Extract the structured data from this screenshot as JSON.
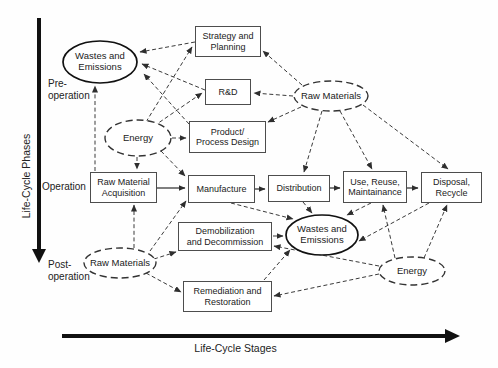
{
  "figure": {
    "y_axis_label": "Life-Cycle Phases",
    "x_axis_label": "Life-Cycle Stages",
    "phases": {
      "pre": "Pre-\noperation",
      "operation": "Operation",
      "post": "Post-\noperation"
    }
  },
  "nodes": {
    "strategy-planning": {
      "label": "Strategy and\nPlanning",
      "shape": "box"
    },
    "rd": {
      "label": "R&D",
      "shape": "box"
    },
    "product-process-design": {
      "label": "Product/\nProcess Design",
      "shape": "box"
    },
    "raw-material-acquisition": {
      "label": "Raw Material\nAcquisition",
      "shape": "box"
    },
    "manufacture": {
      "label": "Manufacture",
      "shape": "box"
    },
    "distribution": {
      "label": "Distribution",
      "shape": "box"
    },
    "use-reuse-maintainance": {
      "label": "Use, Reuse,\nMaintainance",
      "shape": "box"
    },
    "disposal-recycle": {
      "label": "Disposal,\nRecycle",
      "shape": "box"
    },
    "demobilization-decommission": {
      "label": "Demobilization\nand Decommission",
      "shape": "box"
    },
    "remediation-restoration": {
      "label": "Remediation and\nRestoration",
      "shape": "box"
    },
    "wastes-emissions-pre": {
      "label": "Wastes and\nEmissions",
      "shape": "ellipse-solid"
    },
    "wastes-emissions-mid": {
      "label": "Wastes and\nEmissions",
      "shape": "ellipse-solid"
    },
    "energy-pre": {
      "label": "Energy",
      "shape": "ellipse-dashed"
    },
    "energy-post": {
      "label": "Energy",
      "shape": "ellipse-dashed"
    },
    "raw-materials-pre": {
      "label": "Raw Materials",
      "shape": "ellipse-dashed"
    },
    "raw-materials-post": {
      "label": "Raw Materials",
      "shape": "ellipse-dashed"
    }
  },
  "edges": {
    "solid": [
      {
        "from": "raw-material-acquisition",
        "to": "manufacture"
      },
      {
        "from": "manufacture",
        "to": "distribution"
      },
      {
        "from": "distribution",
        "to": "use-reuse-maintainance"
      },
      {
        "from": "use-reuse-maintainance",
        "to": "disposal-recycle"
      }
    ],
    "dashed": [
      {
        "from": "strategy-planning",
        "to": "wastes-emissions-pre"
      },
      {
        "from": "rd",
        "to": "wastes-emissions-pre"
      },
      {
        "from": "product-process-design",
        "to": "wastes-emissions-pre"
      },
      {
        "from": "raw-material-acquisition",
        "to": "wastes-emissions-pre"
      },
      {
        "from": "energy-pre",
        "to": "strategy-planning"
      },
      {
        "from": "energy-pre",
        "to": "rd"
      },
      {
        "from": "energy-pre",
        "to": "product-process-design"
      },
      {
        "from": "energy-pre",
        "to": "raw-material-acquisition"
      },
      {
        "from": "energy-pre",
        "to": "manufacture"
      },
      {
        "from": "raw-materials-pre",
        "to": "strategy-planning"
      },
      {
        "from": "raw-materials-pre",
        "to": "rd"
      },
      {
        "from": "raw-materials-pre",
        "to": "product-process-design"
      },
      {
        "from": "raw-materials-pre",
        "to": "distribution"
      },
      {
        "from": "raw-materials-pre",
        "to": "use-reuse-maintainance"
      },
      {
        "from": "raw-materials-pre",
        "to": "disposal-recycle"
      },
      {
        "from": "manufacture",
        "to": "wastes-emissions-mid"
      },
      {
        "from": "distribution",
        "to": "wastes-emissions-mid"
      },
      {
        "from": "use-reuse-maintainance",
        "to": "wastes-emissions-mid"
      },
      {
        "from": "disposal-recycle",
        "to": "wastes-emissions-mid"
      },
      {
        "from": "energy-post",
        "to": "use-reuse-maintainance"
      },
      {
        "from": "energy-post",
        "to": "disposal-recycle"
      },
      {
        "from": "raw-materials-post",
        "to": "raw-material-acquisition"
      },
      {
        "from": "raw-materials-post",
        "to": "manufacture"
      },
      {
        "from": "raw-materials-post",
        "to": "demobilization-decommission"
      },
      {
        "from": "raw-materials-post",
        "to": "remediation-restoration"
      },
      {
        "from": "energy-post",
        "to": "demobilization-decommission"
      },
      {
        "from": "energy-post",
        "to": "remediation-restoration"
      },
      {
        "from": "demobilization-decommission",
        "to": "wastes-emissions-mid"
      },
      {
        "from": "remediation-restoration",
        "to": "wastes-emissions-mid"
      }
    ]
  },
  "colors": {
    "line": "#3a3a3a",
    "axis": "#111111",
    "box_border": "#4d4d4d",
    "text": "#1c1c1c",
    "background": "#fefefe"
  }
}
